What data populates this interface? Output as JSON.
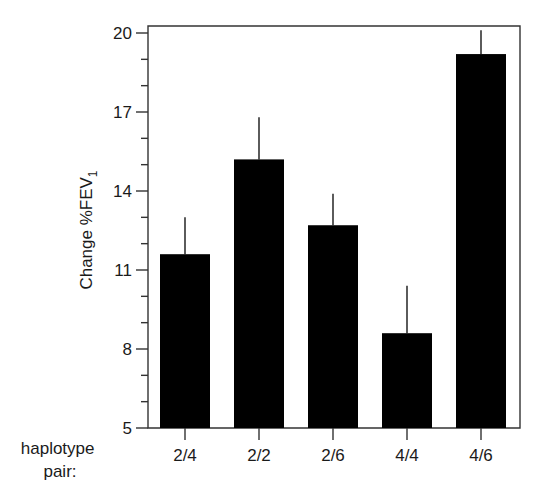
{
  "chart_data": {
    "type": "bar",
    "title": "",
    "xlabel": "haplotype pair:",
    "xlabel_lines": [
      "haplotype",
      "pair:"
    ],
    "ylabel": "Change %FEV1",
    "ylabel_main": "Change %FEV",
    "ylabel_subscript": "1",
    "categories": [
      "2/4",
      "2/2",
      "2/6",
      "4/4",
      "4/6"
    ],
    "values": [
      11.6,
      15.2,
      12.7,
      8.6,
      19.2
    ],
    "error_upper": [
      13.0,
      16.8,
      13.9,
      10.4,
      20.1
    ],
    "error_size": [
      1.4,
      1.6,
      1.2,
      1.8,
      0.9
    ],
    "ylim": [
      5,
      20
    ],
    "yticks_major": [
      5,
      8,
      11,
      14,
      17,
      20
    ],
    "yticks_minor_step": 1,
    "yticks_labels": [
      "5",
      "8",
      "11",
      "14",
      "17",
      "20"
    ],
    "grid": false,
    "legend": null,
    "bar_color": "#000000",
    "frame": "box"
  }
}
